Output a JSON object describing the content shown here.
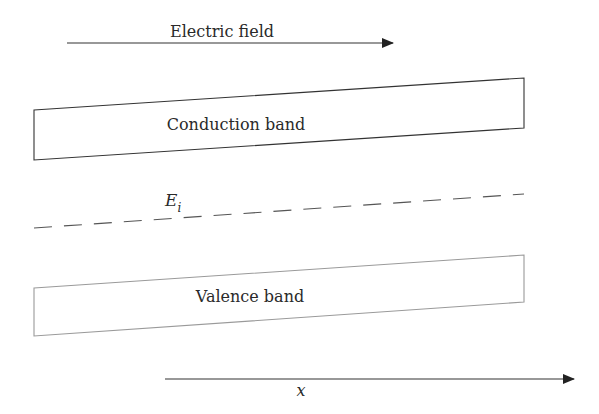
{
  "diagram": {
    "type": "energy-band-diagram",
    "electric_field": {
      "label": "Electric field",
      "direction": "right"
    },
    "conduction_band": {
      "label": "Conduction band"
    },
    "intrinsic_level": {
      "label_main": "E",
      "label_sub": "i",
      "style": "dashed"
    },
    "valence_band": {
      "label": "Valence band"
    },
    "x_axis": {
      "label": "x",
      "direction": "right"
    },
    "colors": {
      "stroke": "#333333",
      "valence_stroke": "#9a9a9a",
      "text": "#2a2a2a",
      "background": "#ffffff"
    }
  }
}
